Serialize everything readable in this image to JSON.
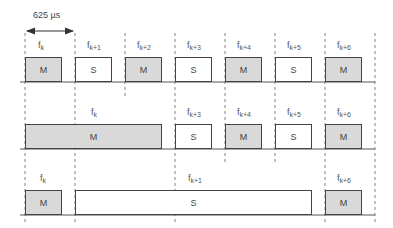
{
  "diagram": {
    "duration_label": "625 µs",
    "colors": {
      "master": "#d9d9d9",
      "slave": "#ffffff",
      "line": "#444444"
    },
    "slot_lines_x": [
      25,
      75,
      125,
      175,
      225,
      275,
      325,
      375
    ],
    "rows": [
      {
        "name": "single-slot",
        "slots": [
          {
            "freq": "f",
            "sub": "k",
            "type": "M"
          },
          {
            "freq": "f",
            "sub": "k+1",
            "type": "S"
          },
          {
            "freq": "f",
            "sub": "k+2",
            "type": "M"
          },
          {
            "freq": "f",
            "sub": "k+3",
            "type": "S"
          },
          {
            "freq": "f",
            "sub": "k+4",
            "type": "M"
          },
          {
            "freq": "f",
            "sub": "k+5",
            "type": "S"
          },
          {
            "freq": "f",
            "sub": "k+6",
            "type": "M"
          }
        ]
      },
      {
        "name": "three-slot",
        "slots": [
          {
            "freq": "f",
            "sub": "k",
            "type": "M"
          },
          {
            "freq": "f",
            "sub": "k+3",
            "type": "S"
          },
          {
            "freq": "f",
            "sub": "k+4",
            "type": "M"
          },
          {
            "freq": "f",
            "sub": "k+5",
            "type": "S"
          },
          {
            "freq": "f",
            "sub": "k+6",
            "type": "M"
          }
        ]
      },
      {
        "name": "five-slot",
        "slots": [
          {
            "freq": "f",
            "sub": "k",
            "type": "M"
          },
          {
            "freq": "f",
            "sub": "k+1",
            "type": "S"
          },
          {
            "freq": "f",
            "sub": "k+6",
            "type": "M"
          }
        ]
      }
    ]
  }
}
